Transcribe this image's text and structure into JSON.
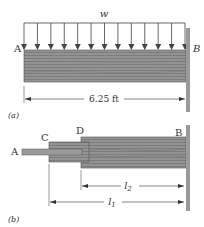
{
  "figure_a": {
    "load_label": "w",
    "point_left": "A",
    "point_right": "B",
    "span_label": "6.25 ft",
    "caption": "(a)",
    "arrow_count": 13
  },
  "figure_b": {
    "point_a": "A",
    "point_c": "C",
    "point_d": "D",
    "point_b": "B",
    "dim_l2": "l",
    "dim_l2_sub": "2",
    "dim_l1": "l",
    "dim_l1_sub": "1",
    "caption": "(b)"
  },
  "colors": {
    "beam_fill": "#8f8f8f",
    "beam_grain": "#6e6e6e",
    "wall": "#9a9a9a",
    "line": "#444444"
  }
}
